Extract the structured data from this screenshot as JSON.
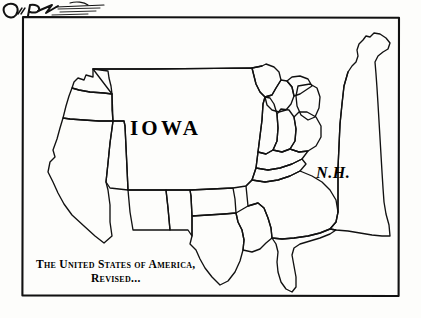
{
  "artwork": {
    "kind": "editorial-cartoon",
    "medium": "pen-and-ink line drawing",
    "palette": {
      "ink": "#000000",
      "paper": "#fdfdfb"
    },
    "frame": {
      "present": true,
      "style": "hand-drawn rectangle"
    }
  },
  "labels": {
    "iowa": "IOWA",
    "new_hampshire": "N.H."
  },
  "caption": {
    "line_1": "The United States of America,",
    "line_2": "Revised..."
  },
  "signature": {
    "legible": false,
    "description": "artist-signature-scribble"
  },
  "map": {
    "subject": "United States of America",
    "satire": "Iowa and New Hampshire drawn enormously oversized",
    "oversized_states": [
      "Iowa",
      "New Hampshire"
    ],
    "visible_state_outlines": [
      "Washington",
      "Oregon",
      "California",
      "Nevada",
      "Arizona",
      "New Mexico",
      "Texas",
      "Oklahoma",
      "Minnesota",
      "Wisconsin",
      "Michigan",
      "Illinois",
      "Indiana",
      "Ohio",
      "Kentucky",
      "Tennessee",
      "Florida"
    ]
  }
}
